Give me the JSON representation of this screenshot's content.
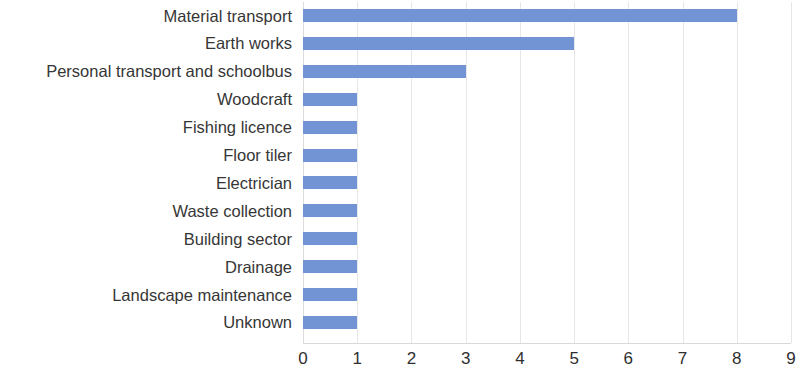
{
  "chart_data": {
    "type": "bar",
    "orientation": "horizontal",
    "title": "",
    "subtitle": "",
    "xlabel": "",
    "ylabel": "",
    "categories": [
      "Material transport",
      "Earth works",
      "Personal transport and schoolbus",
      "Woodcraft",
      "Fishing licence",
      "Floor tiler",
      "Electrician",
      "Waste collection",
      "Building sector",
      "Drainage",
      "Landscape maintenance",
      "Unknown"
    ],
    "values": [
      8,
      5,
      3,
      1,
      1,
      1,
      1,
      1,
      1,
      1,
      1,
      1
    ],
    "xlim": [
      0,
      9
    ],
    "xticks": [
      "0",
      "1",
      "2",
      "3",
      "4",
      "5",
      "6",
      "7",
      "8",
      "9"
    ],
    "xtick_values": [
      0,
      1,
      2,
      3,
      4,
      5,
      6,
      7,
      8,
      9
    ],
    "grid": "vertical",
    "legend": "none",
    "bar_color": "#7293d4",
    "gridline_color": "#e6e6e6",
    "label_color": "#363636",
    "tick_color": "#2f2f2f",
    "background": "#ffffff"
  }
}
